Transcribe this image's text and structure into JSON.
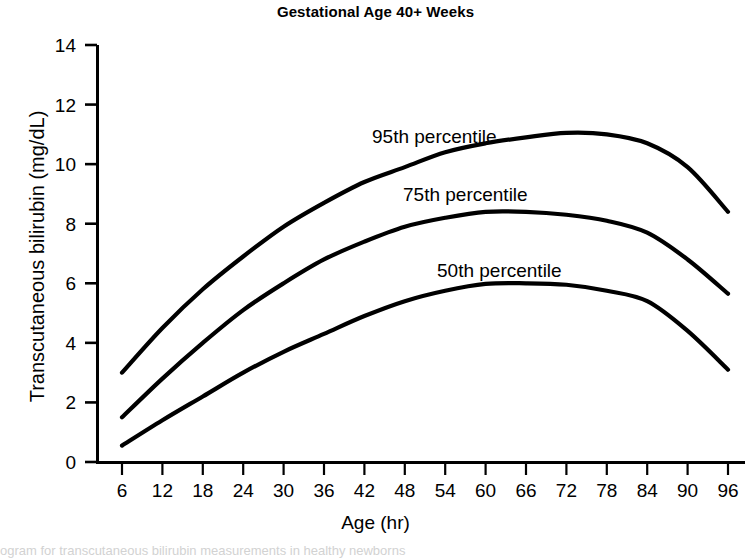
{
  "chart_data": {
    "type": "line",
    "title": "Gestational Age 40+ Weeks",
    "xlabel": "Age (hr)",
    "ylabel": "Transcutaneous bilirubin (mg/dL)",
    "xlim": [
      0,
      99
    ],
    "ylim": [
      0,
      14
    ],
    "grid": false,
    "legend_position": "inline-labels-on-curves",
    "xticks": [
      6,
      12,
      18,
      24,
      30,
      36,
      42,
      48,
      54,
      60,
      66,
      72,
      78,
      84,
      90,
      96
    ],
    "yticks": [
      0,
      2,
      4,
      6,
      8,
      10,
      12,
      14
    ],
    "x": [
      6,
      12,
      18,
      24,
      30,
      36,
      42,
      48,
      54,
      60,
      66,
      72,
      78,
      84,
      90,
      96
    ],
    "series": [
      {
        "name": "95th percentile",
        "label": "95th percentile",
        "color": "#000000",
        "values": [
          3.0,
          4.5,
          5.8,
          6.9,
          7.9,
          8.7,
          9.4,
          9.9,
          10.4,
          10.7,
          10.9,
          11.05,
          11.0,
          10.7,
          9.9,
          8.4
        ]
      },
      {
        "name": "75th percentile",
        "label": "75th percentile",
        "color": "#000000",
        "values": [
          1.5,
          2.8,
          4.0,
          5.1,
          6.0,
          6.8,
          7.4,
          7.9,
          8.2,
          8.4,
          8.4,
          8.3,
          8.1,
          7.7,
          6.8,
          5.65
        ]
      },
      {
        "name": "50th percentile",
        "label": "50th percentile",
        "color": "#000000",
        "values": [
          0.55,
          1.4,
          2.2,
          3.0,
          3.7,
          4.3,
          4.9,
          5.4,
          5.75,
          5.98,
          6.0,
          5.95,
          5.75,
          5.4,
          4.4,
          3.1
        ]
      }
    ]
  },
  "caption": {
    "text": "ogram for transcutaneous bilirubin measurements in healthy newborns"
  }
}
